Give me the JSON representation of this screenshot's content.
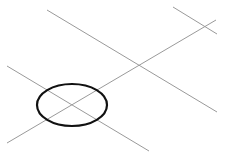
{
  "diagram": {
    "width": 231,
    "height": 157,
    "background": "#ffffff",
    "line_color": "#9a9a9a",
    "ellipse_color": "#111111",
    "lines": [
      {
        "name": "upper-diagonal-line",
        "x1": 47,
        "y1": 10,
        "x2": 217,
        "y2": 112
      },
      {
        "name": "lower-diagonal-line",
        "x1": 7,
        "y1": 66,
        "x2": 149,
        "y2": 151
      },
      {
        "name": "rising-diagonal-line",
        "x1": 7,
        "y1": 143,
        "x2": 216,
        "y2": 20
      },
      {
        "name": "short-top-right-line",
        "x1": 173,
        "y1": 7,
        "x2": 217,
        "y2": 34
      }
    ],
    "ellipse": {
      "cx": 72,
      "cy": 105,
      "rx": 35,
      "ry": 21,
      "stroke_width": 2.2
    }
  }
}
